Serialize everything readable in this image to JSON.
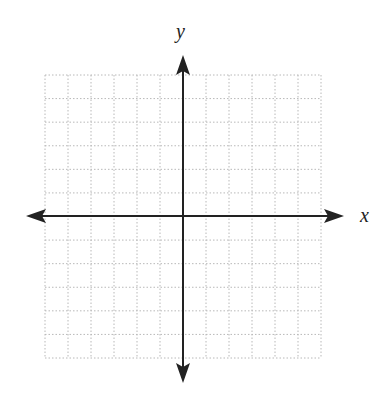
{
  "diagram": {
    "type": "coordinate-plane",
    "x_axis_label": "x",
    "y_axis_label": "y",
    "grid": {
      "columns": 12,
      "rows": 12,
      "line_style": "dotted",
      "line_color": "#b8b8b8"
    },
    "axes": {
      "color": "#222222",
      "arrows": [
        "left",
        "right",
        "up",
        "down"
      ]
    }
  }
}
